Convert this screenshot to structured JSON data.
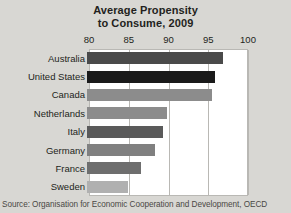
{
  "chart_data": {
    "type": "bar",
    "orientation": "horizontal",
    "title": "Average Propensity to Consume, 2009",
    "title_lines": [
      "Average Propensity",
      "to Consume, 2009"
    ],
    "xlabel": "",
    "ylabel": "",
    "xlim": [
      80,
      100
    ],
    "ticks": [
      80,
      85,
      90,
      95,
      100
    ],
    "tick_labels": [
      "80",
      "85",
      "90",
      "95",
      "100"
    ],
    "grid": true,
    "legend": null,
    "categories": [
      "Australia",
      "United States",
      "Canada",
      "Netherlands",
      "Italy",
      "Germany",
      "France",
      "Sweden"
    ],
    "values": [
      97.1,
      96.1,
      95.7,
      90.0,
      89.6,
      88.5,
      86.8,
      85.1
    ],
    "bar_colors": [
      "#4a4a4a",
      "#1a1a1a",
      "#8c8c8c",
      "#8c8c8c",
      "#5a5a5a",
      "#808080",
      "#6e6e6e",
      "#b0b0b0"
    ],
    "source": "Source: Organisation for Economic Cooperation and Development, OECD"
  },
  "colors": {
    "page_background": "#d8d7d3",
    "plot_background": "#ffffff",
    "gridline": "#b9b8b4",
    "text": "#231f20"
  }
}
